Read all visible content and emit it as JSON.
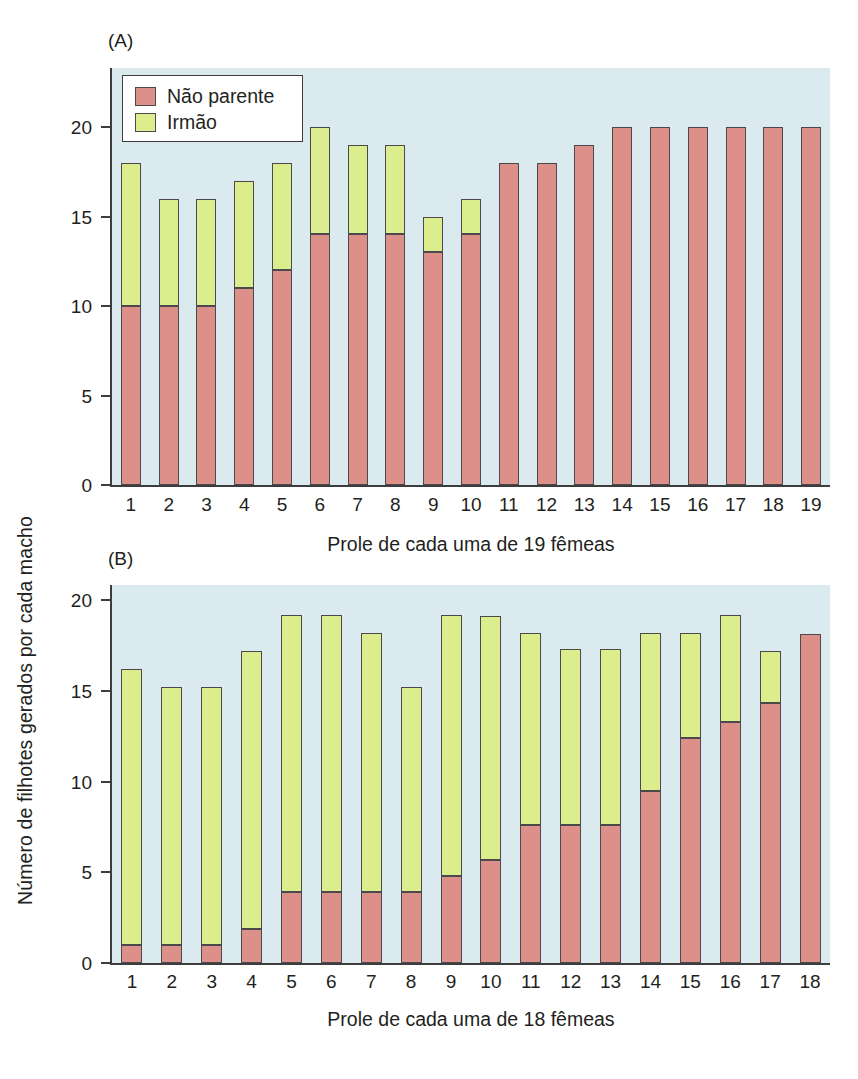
{
  "figure": {
    "y_axis_title": "Número de filhotes gerados por cada macho",
    "legend": {
      "items": [
        {
          "label": "Não parente",
          "color": "#dd9089",
          "key": "nonkin"
        },
        {
          "label": "Irmão",
          "color": "#dced8d",
          "key": "kin"
        }
      ]
    },
    "colors": {
      "nonkin": "#dd9089",
      "kin": "#dced8d",
      "plot_background": "#dbeaef",
      "axis": "#3d3d40",
      "bar_outline": "#4a4a4d",
      "text": "#231f20"
    }
  },
  "panels": [
    {
      "letter": "(A)",
      "xlabel": "Prole de cada uma de 19 fêmeas",
      "ytick_labels": [
        "0",
        "5",
        "10",
        "15",
        "20"
      ],
      "xtick_labels": [
        "1",
        "2",
        "3",
        "4",
        "5",
        "6",
        "7",
        "8",
        "9",
        "10",
        "11",
        "12",
        "13",
        "14",
        "15",
        "16",
        "17",
        "18",
        "19"
      ]
    },
    {
      "letter": "(B)",
      "xlabel": "Prole de cada uma de 18 fêmeas",
      "ytick_labels": [
        "0",
        "5",
        "10",
        "15",
        "20"
      ],
      "xtick_labels": [
        "1",
        "2",
        "3",
        "4",
        "5",
        "6",
        "7",
        "8",
        "9",
        "10",
        "11",
        "12",
        "13",
        "14",
        "15",
        "16",
        "17",
        "18"
      ]
    }
  ],
  "chart_data": [
    {
      "type": "bar",
      "subtype": "stacked",
      "title": "(A)",
      "xlabel": "Prole de cada uma de 19 fêmeas",
      "ylabel": "Número de filhotes gerados por cada macho",
      "ylim": [
        0,
        23
      ],
      "yticks": [
        0,
        5,
        10,
        15,
        20
      ],
      "grid": false,
      "legend_position": "upper-left-inside",
      "categories": [
        "1",
        "2",
        "3",
        "4",
        "5",
        "6",
        "7",
        "8",
        "9",
        "10",
        "11",
        "12",
        "13",
        "14",
        "15",
        "16",
        "17",
        "18",
        "19"
      ],
      "series": [
        {
          "name": "Não parente",
          "color": "#dd9089",
          "values": [
            10,
            10,
            10,
            11,
            12,
            14,
            14,
            14,
            13,
            14,
            18,
            18,
            19,
            20,
            20,
            20,
            20,
            20,
            20
          ]
        },
        {
          "name": "Irmão",
          "color": "#dced8d",
          "values": [
            8,
            6,
            6,
            6,
            6,
            6,
            5,
            5,
            2,
            2,
            0,
            0,
            0,
            0,
            0,
            0,
            0,
            0,
            0
          ]
        }
      ],
      "totals": [
        18,
        16,
        16,
        17,
        18,
        20,
        19,
        19,
        15,
        16,
        18,
        18,
        19,
        20,
        20,
        20,
        20,
        20,
        20
      ]
    },
    {
      "type": "bar",
      "subtype": "stacked",
      "title": "(B)",
      "xlabel": "Prole de cada uma de 18 fêmeas",
      "ylabel": "Número de filhotes gerados por cada macho",
      "ylim": [
        0,
        21.5
      ],
      "yticks": [
        0,
        5,
        10,
        15,
        20
      ],
      "grid": false,
      "legend_position": "none",
      "categories": [
        "1",
        "2",
        "3",
        "4",
        "5",
        "6",
        "7",
        "8",
        "9",
        "10",
        "11",
        "12",
        "13",
        "14",
        "15",
        "16",
        "17",
        "18"
      ],
      "series": [
        {
          "name": "Não parente",
          "color": "#dd9089",
          "values": [
            1.0,
            1.0,
            1.0,
            1.9,
            3.9,
            3.9,
            3.9,
            3.9,
            4.8,
            5.7,
            7.6,
            7.6,
            7.6,
            9.5,
            12.4,
            13.3,
            14.3,
            18.1
          ]
        },
        {
          "name": "Irmão",
          "color": "#dced8d",
          "values": [
            15.2,
            14.2,
            14.2,
            15.3,
            15.3,
            15.3,
            14.3,
            11.3,
            14.4,
            13.4,
            10.6,
            9.7,
            9.7,
            8.7,
            5.8,
            5.9,
            2.9,
            0
          ]
        }
      ],
      "totals": [
        16.2,
        15.2,
        15.2,
        17.2,
        19.2,
        19.2,
        18.2,
        15.2,
        19.2,
        19.1,
        18.2,
        17.3,
        17.3,
        18.2,
        18.2,
        19.2,
        17.2,
        18.1
      ]
    }
  ]
}
